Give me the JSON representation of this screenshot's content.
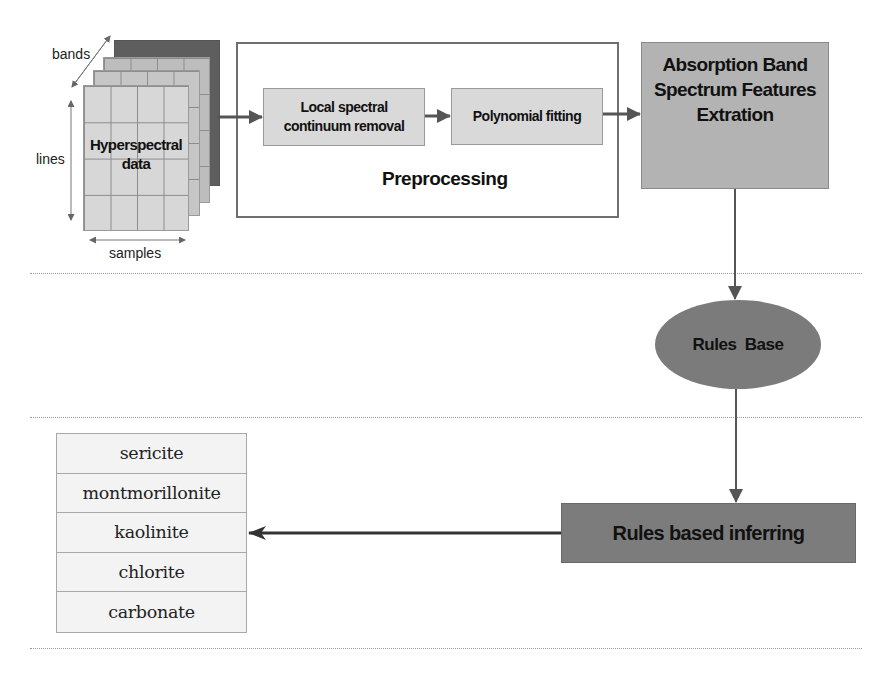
{
  "diagram": {
    "input": {
      "cube_label": "Hyperspectral data",
      "cube_label_lines": [
        "Hyperspectral",
        "data"
      ],
      "axes": {
        "bands": "bands",
        "lines": "lines",
        "samples": "samples"
      }
    },
    "preprocessing": {
      "title": "Preprocessing",
      "steps": [
        {
          "label": "Local spectral continuum removal",
          "lines": [
            "Local spectral",
            "continuum removal"
          ]
        },
        {
          "label": "Polynomial fitting"
        }
      ]
    },
    "feature_extraction": {
      "label": "Absorption Band Spectrum Features Extration",
      "lines": [
        "Absorption Band",
        "Spectrum Features",
        "Extration"
      ]
    },
    "rules_base": {
      "label": "Rules  Base"
    },
    "inference": {
      "label": "Rules based inferring"
    },
    "minerals": {
      "items": [
        "sericite",
        "montmorillonite",
        "kaolinite",
        "chlorite",
        "carbonate"
      ]
    },
    "colors": {
      "arrow": "#555555",
      "extraction_box": "#b3b3b3",
      "rules_base": "#7b7b7b",
      "inference_box": "#7c7c7c",
      "cube_back_layer": "#5e5e5e"
    }
  }
}
